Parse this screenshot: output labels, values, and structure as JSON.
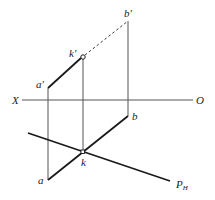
{
  "diagram": {
    "type": "descriptive-geometry-projection",
    "axis": {
      "left_label": "X",
      "right_label": "O"
    },
    "points": {
      "a_prime": {
        "label": "a",
        "mark": "′"
      },
      "k_prime": {
        "label": "k",
        "mark": "′"
      },
      "b_prime": {
        "label": "b",
        "mark": "′"
      },
      "a": {
        "label": "a"
      },
      "k": {
        "label": "k"
      },
      "b": {
        "label": "b"
      }
    },
    "plane_trace": {
      "label": "P",
      "subscript": "H"
    },
    "colors": {
      "line": "#1a1a1a",
      "thin": "#555555",
      "background": "#ffffff"
    }
  }
}
